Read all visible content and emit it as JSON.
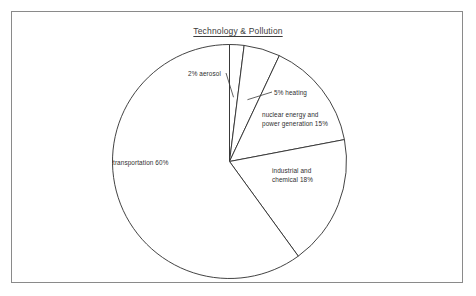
{
  "figure": {
    "title": "Technology & Pollution",
    "border_color": "#8a8a8a",
    "background": "#ffffff",
    "line_color": "#2e2e2e"
  },
  "chart_data": {
    "type": "pie",
    "title": "Technology & Pollution",
    "xlabel": "",
    "ylabel": "",
    "total": 100,
    "units": "percent",
    "start_angle_deg": 0,
    "direction": "clockwise",
    "legend": "none",
    "grid": false,
    "categories": [
      "2% aerosol",
      "5% heating",
      "nuclear energy and power generation 15%",
      "industrial and chemical 18%",
      "transportation 60%"
    ],
    "values": [
      2,
      5,
      15,
      18,
      60
    ],
    "slices": [
      {
        "name": "aerosol",
        "value": 2,
        "label": "2% aerosol",
        "label_lines": [
          "2% aerosol"
        ],
        "label_placement": "outside-left",
        "leader_line": true
      },
      {
        "name": "heating",
        "value": 5,
        "label": "5% heating",
        "label_lines": [
          "5% heating"
        ],
        "label_placement": "outside-right",
        "leader_line": true
      },
      {
        "name": "nuclear-energy-power-generation",
        "value": 15,
        "label": "nuclear energy and power generation 15%",
        "label_lines": [
          "nuclear energy and",
          "power generation 15%"
        ],
        "label_placement": "inside",
        "leader_line": false
      },
      {
        "name": "industrial-chemical",
        "value": 18,
        "label": "industrial and chemical 18%",
        "label_lines": [
          "industrial and",
          "chemical 18%"
        ],
        "label_placement": "inside",
        "leader_line": false
      },
      {
        "name": "transportation",
        "value": 60,
        "label": "transportation 60%",
        "label_lines": [
          "transportation 60%"
        ],
        "label_placement": "inside",
        "leader_line": false
      }
    ]
  }
}
